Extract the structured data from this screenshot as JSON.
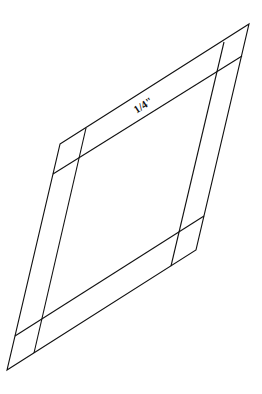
{
  "diagram": {
    "type": "parallelogram-with-border",
    "label": "1/4\"",
    "stroke_color": "#111111",
    "background": "#ffffff",
    "outer_vertices": {
      "top_left": [
        60,
        144
      ],
      "top_right": [
        249,
        24
      ],
      "bottom_right": [
        196,
        250
      ],
      "bottom_left": [
        7,
        370
      ]
    },
    "inner_lines": {
      "top": [
        [
          53,
          174
        ],
        [
          242,
          56
        ]
      ],
      "bottom": [
        [
          15,
          336
        ],
        [
          204,
          216
        ]
      ],
      "left": [
        [
          86,
          128
        ],
        [
          34,
          353
        ]
      ],
      "right": [
        [
          224,
          42
        ],
        [
          171,
          266
        ]
      ]
    }
  }
}
